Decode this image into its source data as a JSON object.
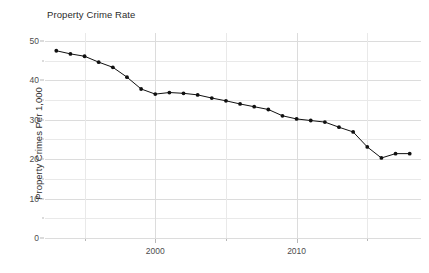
{
  "chart_data": {
    "type": "line",
    "title": "Property Crime Rate",
    "xlabel": "",
    "ylabel": "Property Crimes Per 1,000",
    "xlim": [
      1992.2,
      2018.8
    ],
    "ylim": [
      0,
      52
    ],
    "grid": true,
    "legend": null,
    "y_ticks": [
      0,
      10,
      20,
      30,
      40,
      50
    ],
    "y_tick_labels": [
      "0",
      "10",
      "20",
      "30",
      "40",
      "50"
    ],
    "y_minor_ticks": [
      5,
      15,
      25,
      35,
      45
    ],
    "x_ticks": [
      2000,
      2010
    ],
    "x_tick_labels": [
      "2000",
      "2010"
    ],
    "x_minor_ticks": [
      1995,
      2005,
      2015
    ],
    "marker": "filled-circle",
    "marker_color": "#111111",
    "line_color": "#111111",
    "x": [
      1993,
      1994,
      1995,
      1996,
      1997,
      1998,
      1999,
      2000,
      2001,
      2002,
      2003,
      2004,
      2005,
      2006,
      2007,
      2008,
      2009,
      2010,
      2011,
      2012,
      2013,
      2014,
      2015,
      2016,
      2017,
      2018
    ],
    "values": [
      47.5,
      46.7,
      46.1,
      44.6,
      43.3,
      40.8,
      37.8,
      36.5,
      36.9,
      36.7,
      36.3,
      35.5,
      34.8,
      34.0,
      33.3,
      32.6,
      31.0,
      30.2,
      29.8,
      29.4,
      28.1,
      26.9,
      23.1,
      20.3,
      21.4,
      21.4
    ],
    "series": [
      {
        "name": "Property Crime Rate",
        "values": [
          47.5,
          46.7,
          46.1,
          44.6,
          43.3,
          40.8,
          37.8,
          36.5,
          36.9,
          36.7,
          36.3,
          35.5,
          34.8,
          34.0,
          33.3,
          32.6,
          31.0,
          30.2,
          29.8,
          29.4,
          28.1,
          26.9,
          23.1,
          20.3,
          21.4,
          21.4
        ]
      }
    ]
  }
}
